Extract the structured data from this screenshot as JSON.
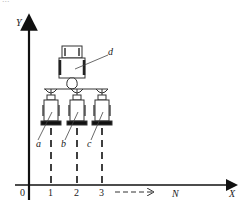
{
  "caption_fragment": "...",
  "axes": {
    "y_label": "Y",
    "x_label": "X",
    "origin_label": "0",
    "x_ticks": [
      "1",
      "2",
      "3"
    ],
    "direction_label": "N"
  },
  "parts": {
    "tractor_label": "d",
    "implements": [
      {
        "label": "a"
      },
      {
        "label": "b"
      },
      {
        "label": "c"
      }
    ]
  }
}
